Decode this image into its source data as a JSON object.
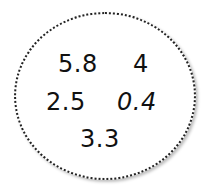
{
  "diagram": {
    "shape": "dotted-ellipse",
    "values": [
      "5.8",
      "4",
      "2.5",
      "0.4",
      "3.3"
    ]
  }
}
